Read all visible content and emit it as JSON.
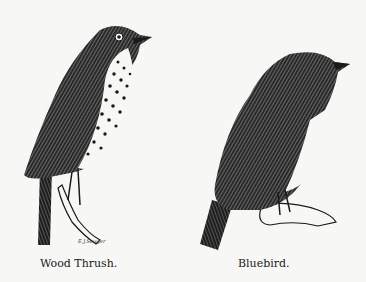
{
  "figures": [
    {
      "caption": "Wood Thrush."
    },
    {
      "caption": "Bluebird."
    }
  ],
  "signature": "E.J.Sawyer",
  "colors": {
    "background": "#f7f7f5",
    "ink": "#1a1a1a"
  }
}
